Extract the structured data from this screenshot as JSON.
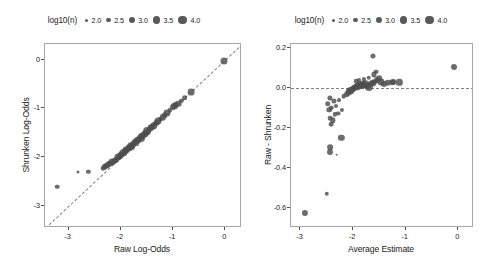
{
  "figure": {
    "width": 495,
    "height": 264,
    "background": "#ffffff",
    "point_color": "#4d4d4d",
    "refline_color": "#808080",
    "frame_color": "#a6a6a6"
  },
  "legend": {
    "title": "log10(n)",
    "keys": [
      {
        "label": "2.0",
        "size": 3.0
      },
      {
        "label": "2.5",
        "size": 4.4
      },
      {
        "label": "3.0",
        "size": 5.8
      },
      {
        "label": "3.5",
        "size": 7.2
      },
      {
        "label": "4.0",
        "size": 8.8
      }
    ]
  },
  "chart_data": [
    {
      "id": "left",
      "type": "scatter",
      "title": "",
      "xlabel": "Raw Log-Odds",
      "ylabel": "Shrunken Log-Odds",
      "xlim": [
        -3.45,
        0.32
      ],
      "ylim": [
        -3.45,
        0.32
      ],
      "xticks": [
        -3,
        -2,
        -1,
        0
      ],
      "yticks": [
        0,
        -1,
        -2,
        -3
      ],
      "xticklabels": [
        "-3",
        "-2",
        "-1",
        "0"
      ],
      "yticklabels": [
        "0",
        "-1",
        "-2",
        "-3"
      ],
      "grid": false,
      "legend_position": "top",
      "reference_line": {
        "type": "identity",
        "style": "dashed",
        "label": "y = x"
      },
      "size_variable": "log10(n)",
      "points": [
        {
          "x": -3.22,
          "y": -2.6,
          "n": 2.55
        },
        {
          "x": -2.82,
          "y": -2.3,
          "n": 2.05
        },
        {
          "x": -2.62,
          "y": -2.3,
          "n": 2.45
        },
        {
          "x": -2.34,
          "y": -2.22,
          "n": 2.6
        },
        {
          "x": -2.31,
          "y": -2.2,
          "n": 3.2
        },
        {
          "x": -2.28,
          "y": -2.19,
          "n": 2.3
        },
        {
          "x": -2.26,
          "y": -2.16,
          "n": 2.9
        },
        {
          "x": -2.22,
          "y": -2.14,
          "n": 3.05
        },
        {
          "x": -2.2,
          "y": -2.12,
          "n": 2.7
        },
        {
          "x": -2.16,
          "y": -2.1,
          "n": 3.35
        },
        {
          "x": -2.13,
          "y": -2.08,
          "n": 2.85
        },
        {
          "x": -2.1,
          "y": -2.06,
          "n": 3.1
        },
        {
          "x": -2.07,
          "y": -2.03,
          "n": 2.6
        },
        {
          "x": -2.05,
          "y": -2.0,
          "n": 3.4
        },
        {
          "x": -2.02,
          "y": -1.98,
          "n": 2.95
        },
        {
          "x": -2.0,
          "y": -1.96,
          "n": 3.25
        },
        {
          "x": -1.97,
          "y": -1.93,
          "n": 2.75
        },
        {
          "x": -1.95,
          "y": -1.91,
          "n": 3.5
        },
        {
          "x": -1.92,
          "y": -1.88,
          "n": 3.0
        },
        {
          "x": -1.9,
          "y": -1.86,
          "n": 3.3
        },
        {
          "x": -1.87,
          "y": -1.84,
          "n": 2.65
        },
        {
          "x": -1.85,
          "y": -1.81,
          "n": 3.45
        },
        {
          "x": -1.82,
          "y": -1.79,
          "n": 2.9
        },
        {
          "x": -1.8,
          "y": -1.77,
          "n": 3.6
        },
        {
          "x": -1.77,
          "y": -1.74,
          "n": 3.15
        },
        {
          "x": -1.75,
          "y": -1.72,
          "n": 2.8
        },
        {
          "x": -1.72,
          "y": -1.7,
          "n": 3.55
        },
        {
          "x": -1.7,
          "y": -1.67,
          "n": 3.05
        },
        {
          "x": -1.67,
          "y": -1.65,
          "n": 3.35
        },
        {
          "x": -1.65,
          "y": -1.62,
          "n": 2.7
        },
        {
          "x": -1.62,
          "y": -1.6,
          "n": 3.7
        },
        {
          "x": -1.6,
          "y": -1.57,
          "n": 3.2
        },
        {
          "x": -1.57,
          "y": -1.55,
          "n": 2.95
        },
        {
          "x": -1.54,
          "y": -1.52,
          "n": 3.45
        },
        {
          "x": -1.52,
          "y": -1.5,
          "n": 3.1
        },
        {
          "x": -1.49,
          "y": -1.47,
          "n": 3.65
        },
        {
          "x": -1.46,
          "y": -1.44,
          "n": 2.85
        },
        {
          "x": -1.43,
          "y": -1.41,
          "n": 3.3
        },
        {
          "x": -1.4,
          "y": -1.38,
          "n": 3.0
        },
        {
          "x": -1.37,
          "y": -1.35,
          "n": 3.55
        },
        {
          "x": -1.34,
          "y": -1.32,
          "n": 2.75
        },
        {
          "x": -1.31,
          "y": -1.29,
          "n": 3.25
        },
        {
          "x": -1.28,
          "y": -1.26,
          "n": 3.4
        },
        {
          "x": -1.24,
          "y": -1.22,
          "n": 2.6
        },
        {
          "x": -1.2,
          "y": -1.18,
          "n": 3.15
        },
        {
          "x": -1.16,
          "y": -1.14,
          "n": 2.9
        },
        {
          "x": -1.12,
          "y": -1.1,
          "n": 3.35
        },
        {
          "x": -1.06,
          "y": -1.04,
          "n": 2.55
        },
        {
          "x": -1.0,
          "y": -0.98,
          "n": 3.05
        },
        {
          "x": -0.97,
          "y": -0.95,
          "n": 3.5
        },
        {
          "x": -0.94,
          "y": -0.93,
          "n": 2.8
        },
        {
          "x": -0.9,
          "y": -0.9,
          "n": 3.2
        },
        {
          "x": -0.84,
          "y": -0.84,
          "n": 2.45
        },
        {
          "x": -0.78,
          "y": -0.78,
          "n": 2.95
        },
        {
          "x": -0.66,
          "y": -0.66,
          "n": 3.3
        },
        {
          "x": -0.02,
          "y": -0.02,
          "n": 3.4
        }
      ]
    },
    {
      "id": "right",
      "type": "scatter",
      "title": "",
      "xlabel": "Average Estimate",
      "ylabel": "Raw - Shrunken",
      "xlim": [
        -3.18,
        0.3
      ],
      "ylim": [
        -0.7,
        0.22
      ],
      "xticks": [
        -3,
        -2,
        -1,
        0
      ],
      "yticks": [
        0.2,
        0.0,
        -0.2,
        -0.4,
        -0.6
      ],
      "xticklabels": [
        "-3",
        "-2",
        "-1",
        "0"
      ],
      "yticklabels": [
        "0.2",
        "0.0",
        "-0.2",
        "-0.4",
        "-0.6"
      ],
      "grid": false,
      "legend_position": "top",
      "reference_line": {
        "type": "horizontal",
        "value": 0.0,
        "style": "dashed"
      },
      "size_variable": "log10(n)",
      "points": [
        {
          "x": -2.91,
          "y": -0.625,
          "n": 3.1
        },
        {
          "x": -2.5,
          "y": -0.528,
          "n": 2.5
        },
        {
          "x": -2.44,
          "y": -0.322,
          "n": 3.05
        },
        {
          "x": -2.43,
          "y": -0.297,
          "n": 2.95
        },
        {
          "x": -2.31,
          "y": -0.333,
          "n": 1.9
        },
        {
          "x": -2.22,
          "y": -0.248,
          "n": 3.15
        },
        {
          "x": -2.41,
          "y": -0.182,
          "n": 2.6
        },
        {
          "x": -2.39,
          "y": -0.162,
          "n": 2.8
        },
        {
          "x": -2.43,
          "y": -0.15,
          "n": 2.55
        },
        {
          "x": -2.35,
          "y": -0.132,
          "n": 2.45
        },
        {
          "x": -2.29,
          "y": -0.128,
          "n": 2.65
        },
        {
          "x": -2.45,
          "y": -0.108,
          "n": 2.85
        },
        {
          "x": -2.41,
          "y": -0.1,
          "n": 2.5
        },
        {
          "x": -2.21,
          "y": -0.11,
          "n": 2.4
        },
        {
          "x": -2.33,
          "y": -0.092,
          "n": 2.35
        },
        {
          "x": -2.48,
          "y": -0.078,
          "n": 2.9
        },
        {
          "x": -2.37,
          "y": -0.065,
          "n": 2.7
        },
        {
          "x": -2.26,
          "y": -0.062,
          "n": 2.3
        },
        {
          "x": -2.44,
          "y": -0.05,
          "n": 2.75
        },
        {
          "x": -2.18,
          "y": -0.04,
          "n": 2.6
        },
        {
          "x": -2.12,
          "y": -0.03,
          "n": 2.95
        },
        {
          "x": -2.08,
          "y": -0.022,
          "n": 3.25
        },
        {
          "x": -2.05,
          "y": -0.015,
          "n": 3.5
        },
        {
          "x": -2.02,
          "y": -0.008,
          "n": 3.3
        },
        {
          "x": -1.99,
          "y": 0.002,
          "n": 3.1
        },
        {
          "x": -1.96,
          "y": 0.006,
          "n": 2.85
        },
        {
          "x": -1.93,
          "y": 0.004,
          "n": 3.4
        },
        {
          "x": -1.9,
          "y": 0.01,
          "n": 3.15
        },
        {
          "x": -1.86,
          "y": 0.014,
          "n": 3.55
        },
        {
          "x": -1.83,
          "y": 0.018,
          "n": 2.95
        },
        {
          "x": -1.8,
          "y": 0.013,
          "n": 3.35
        },
        {
          "x": -1.76,
          "y": 0.02,
          "n": 3.6
        },
        {
          "x": -1.73,
          "y": 0.012,
          "n": 3.2
        },
        {
          "x": -1.7,
          "y": 0.004,
          "n": 3.75
        },
        {
          "x": -1.66,
          "y": 0.022,
          "n": 3.0
        },
        {
          "x": -1.63,
          "y": 0.026,
          "n": 3.45
        },
        {
          "x": -1.58,
          "y": 0.03,
          "n": 2.8
        },
        {
          "x": -1.54,
          "y": 0.04,
          "n": 3.05
        },
        {
          "x": -1.5,
          "y": 0.048,
          "n": 2.9
        },
        {
          "x": -1.46,
          "y": 0.028,
          "n": 3.35
        },
        {
          "x": -1.42,
          "y": 0.022,
          "n": 3.1
        },
        {
          "x": -1.7,
          "y": 0.052,
          "n": 2.55
        },
        {
          "x": -1.79,
          "y": 0.043,
          "n": 2.4
        },
        {
          "x": -1.88,
          "y": 0.038,
          "n": 2.3
        },
        {
          "x": -1.94,
          "y": 0.034,
          "n": 2.5
        },
        {
          "x": -1.6,
          "y": 0.068,
          "n": 2.75
        },
        {
          "x": -1.56,
          "y": 0.082,
          "n": 2.6
        },
        {
          "x": -1.63,
          "y": 0.158,
          "n": 2.7
        },
        {
          "x": -1.34,
          "y": 0.026,
          "n": 3.2
        },
        {
          "x": -1.26,
          "y": 0.03,
          "n": 2.95
        },
        {
          "x": -1.23,
          "y": 0.028,
          "n": 3.0
        },
        {
          "x": -1.12,
          "y": 0.028,
          "n": 3.15
        },
        {
          "x": -0.08,
          "y": 0.105,
          "n": 3.05
        }
      ]
    }
  ]
}
